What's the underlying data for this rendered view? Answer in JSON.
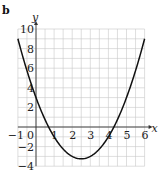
{
  "part_label": "b",
  "chart_data": {
    "type": "line",
    "title": "",
    "xlabel": "x",
    "ylabel": "y",
    "xlim": [
      -1,
      6
    ],
    "ylim": [
      -4,
      10
    ],
    "grid": true,
    "x_ticks": [
      -1,
      0,
      1,
      2,
      3,
      4,
      5,
      6
    ],
    "x_tick_labels": [
      "−1",
      "0",
      "1",
      "2",
      "3",
      "4",
      "5",
      "6"
    ],
    "y_ticks": [
      -4,
      -2,
      2,
      4,
      6,
      8,
      10
    ],
    "y_tick_labels": [
      "−4",
      "−2",
      "2",
      "4",
      "6",
      "8",
      "10"
    ],
    "series": [
      {
        "name": "parabola",
        "equation": "y = x^2 - 5x + 3",
        "x": [
          -1,
          -0.5,
          0,
          0.5,
          1,
          1.5,
          2,
          2.5,
          3,
          3.5,
          4,
          4.5,
          5,
          5.5,
          6
        ],
        "y": [
          9,
          5.75,
          3,
          0.75,
          -1,
          -2.25,
          -3,
          -3.25,
          -3,
          -2.25,
          -1,
          0.75,
          3,
          5.75,
          9
        ]
      }
    ],
    "vertex": [
      2.5,
      -3.25
    ],
    "roots": [
      0.7,
      4.3
    ],
    "y_intercept": 3
  }
}
